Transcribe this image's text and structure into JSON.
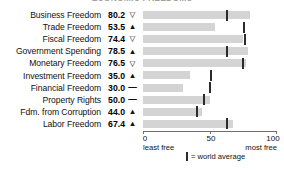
{
  "title": "ECONOMIC FREEDOMS",
  "chart_data": {
    "type": "bar",
    "title": "ECONOMIC FREEDOMS",
    "xlabel": "",
    "ylabel": "",
    "xlim": [
      0,
      100
    ],
    "ticks": [
      0,
      50,
      100
    ],
    "tick_labels": [
      "0",
      "50",
      "100"
    ],
    "axis_end_labels": {
      "left": "least free",
      "right": "most free"
    },
    "grid": false,
    "legend": {
      "marker_label": "= world average",
      "position": "bottom"
    },
    "categories": [
      "Business Freedom",
      "Trade Freedom",
      "Fiscal Freedom",
      "Government Spending",
      "Monetary Freedom",
      "Investment Freedom",
      "Financial Freedom",
      "Property Rights",
      "Fdm. from Corruption",
      "Labor Freedom"
    ],
    "values": [
      80.2,
      53.5,
      74.4,
      78.5,
      76.5,
      35.0,
      30.0,
      50.0,
      44.0,
      67.4
    ],
    "value_labels": [
      "80.2",
      "53.5",
      "74.4",
      "78.5",
      "76.5",
      "35.0",
      "30.0",
      "50.0",
      "44.0",
      "67.4"
    ],
    "trends": [
      "down",
      "up",
      "down",
      "up",
      "down",
      "up",
      "flat",
      "flat",
      "up",
      "up"
    ],
    "trend_glyphs": [
      "▽",
      "▲",
      "▽",
      "▲",
      "▽",
      "▲",
      "—",
      "—",
      "▲",
      "▲"
    ],
    "world_average": [
      62.0,
      74.5,
      75.5,
      62.0,
      74.0,
      50.0,
      49.0,
      44.5,
      39.5,
      62.0
    ]
  },
  "colors": {
    "bar": "#d4d4d4",
    "world_average_marker": "#2b2b2b",
    "axis": "#6e6e6e",
    "text": "#111111",
    "background": "#ffffff"
  }
}
